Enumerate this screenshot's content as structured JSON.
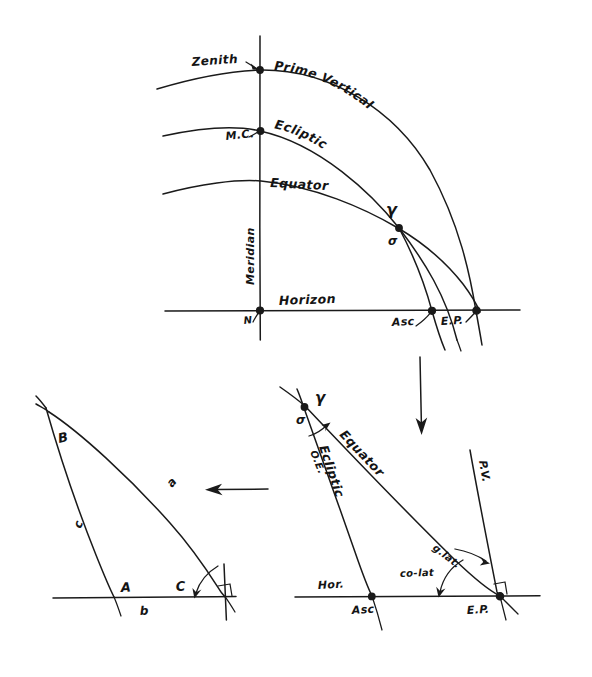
{
  "figure": {
    "background_color": "#ffffff",
    "ink_color": "#1a1a1a",
    "width": 592,
    "height": 677
  },
  "panels": {
    "top": {
      "name": "celestial-sphere-panel",
      "labels": {
        "zenith": "Zenith",
        "prime_vertical": "Prime Vertical",
        "mc": "M.C.",
        "ecliptic": "Ecliptic",
        "equator": "Equator",
        "meridian": "Meridian",
        "horizon": "Horizon",
        "north": "N",
        "asc": "Asc",
        "ep": "E.P.",
        "aries": "γ",
        "sigma": "σ"
      }
    },
    "bottom_right": {
      "name": "plane-triangle-panel",
      "labels": {
        "aries": "γ",
        "sigma": "σ",
        "obliquity": "O.E.",
        "equator": "Equator",
        "ecliptic": "Ecliptic",
        "prime_vertical": "P.V.",
        "g_lat": "g.lat.",
        "co_lat": "co-lat",
        "horizon": "Hor.",
        "asc": "Asc",
        "ep": "E.P."
      }
    },
    "bottom_left": {
      "name": "abstract-triangle-panel",
      "labels": {
        "vertex_b": "B",
        "vertex_a": "A",
        "vertex_c": "C",
        "side_a": "a",
        "side_b": "b",
        "side_c": "c"
      }
    }
  },
  "arrows": {
    "down_arrow": "down-arrow",
    "left_arrow": "left-arrow"
  }
}
